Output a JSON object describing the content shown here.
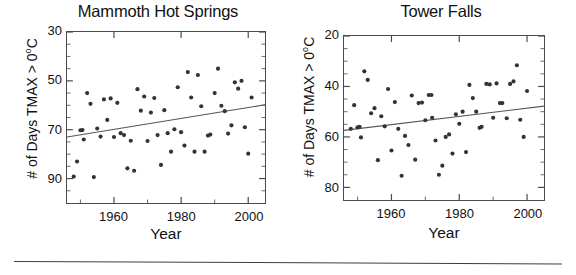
{
  "figure": {
    "panels": [
      {
        "id": "mammoth",
        "title": "Mammoth Hot Springs",
        "xlabel": "Year",
        "ylabel_main": "# of Days TMAX > 0",
        "ylabel_sup": "o",
        "ylabel_tail": "C",
        "ytick_labels": [
          "90",
          "70",
          "50",
          "30"
        ],
        "xtick_labels": [
          "1960",
          "1980",
          "2000"
        ]
      },
      {
        "id": "tower",
        "title": "Tower Falls",
        "xlabel": "Year",
        "ylabel_main": "# of Days TMAX > 0",
        "ylabel_sup": "o",
        "ylabel_tail": "C",
        "ytick_labels": [
          "80",
          "60",
          "40",
          "20"
        ],
        "xtick_labels": [
          "1960",
          "1980",
          "2000"
        ]
      }
    ]
  },
  "chart_data": [
    {
      "type": "scatter",
      "title": "Mammoth Hot Springs",
      "xlabel": "Year",
      "ylabel": "# of Days TMAX > 0°C",
      "xlim": [
        1946,
        2005
      ],
      "ylim": [
        20,
        90
      ],
      "yticks": [
        30,
        50,
        70,
        90
      ],
      "yticks_minor": [
        25,
        35,
        40,
        45,
        55,
        60,
        65,
        75,
        80,
        85
      ],
      "xticks": [
        1960,
        1980,
        2000
      ],
      "grid": false,
      "legend": null,
      "marker_color": "#333333",
      "line_color": "#555555",
      "trendline": {
        "x": [
          1946,
          2005
        ],
        "y": [
          47.0,
          60.2
        ]
      },
      "points": [
        {
          "x": 1948,
          "y": 30.8
        },
        {
          "x": 1949,
          "y": 37.0
        },
        {
          "x": 1950,
          "y": 49.8
        },
        {
          "x": 1950.6,
          "y": 49.9
        },
        {
          "x": 1951,
          "y": 46.0
        },
        {
          "x": 1952,
          "y": 65.0
        },
        {
          "x": 1953,
          "y": 60.6
        },
        {
          "x": 1954,
          "y": 30.6
        },
        {
          "x": 1955,
          "y": 50.5
        },
        {
          "x": 1956,
          "y": 47.2
        },
        {
          "x": 1957,
          "y": 62.4
        },
        {
          "x": 1958,
          "y": 54.0
        },
        {
          "x": 1959,
          "y": 62.8
        },
        {
          "x": 1960,
          "y": 47.0
        },
        {
          "x": 1961,
          "y": 61.0
        },
        {
          "x": 1962,
          "y": 48.6
        },
        {
          "x": 1963,
          "y": 47.8
        },
        {
          "x": 1964,
          "y": 34.2
        },
        {
          "x": 1965,
          "y": 45.5
        },
        {
          "x": 1966,
          "y": 33.2
        },
        {
          "x": 1967,
          "y": 66.6
        },
        {
          "x": 1968,
          "y": 57.8
        },
        {
          "x": 1969,
          "y": 63.6
        },
        {
          "x": 1970,
          "y": 45.4
        },
        {
          "x": 1971,
          "y": 57.0
        },
        {
          "x": 1972,
          "y": 63.0
        },
        {
          "x": 1973,
          "y": 47.8
        },
        {
          "x": 1974,
          "y": 35.6
        },
        {
          "x": 1975,
          "y": 58.0
        },
        {
          "x": 1976,
          "y": 48.6
        },
        {
          "x": 1977,
          "y": 41.0
        },
        {
          "x": 1978,
          "y": 50.2
        },
        {
          "x": 1979,
          "y": 67.4
        },
        {
          "x": 1980,
          "y": 49.0
        },
        {
          "x": 1981,
          "y": 43.5
        },
        {
          "x": 1982,
          "y": 73.6
        },
        {
          "x": 1983,
          "y": 63.2
        },
        {
          "x": 1984,
          "y": 41.0
        },
        {
          "x": 1985,
          "y": 72.4
        },
        {
          "x": 1986,
          "y": 59.6
        },
        {
          "x": 1987,
          "y": 41.0
        },
        {
          "x": 1988,
          "y": 47.6
        },
        {
          "x": 1988.7,
          "y": 48.0
        },
        {
          "x": 1990,
          "y": 65.0
        },
        {
          "x": 1991,
          "y": 75.0
        },
        {
          "x": 1992,
          "y": 59.8
        },
        {
          "x": 1993,
          "y": 57.6
        },
        {
          "x": 1994,
          "y": 48.4
        },
        {
          "x": 1995,
          "y": 51.8
        },
        {
          "x": 1996,
          "y": 69.4
        },
        {
          "x": 1997,
          "y": 66.8
        },
        {
          "x": 1998,
          "y": 70.0
        },
        {
          "x": 1999,
          "y": 51.0
        },
        {
          "x": 2000,
          "y": 40.2
        },
        {
          "x": 2001,
          "y": 63.2
        }
      ]
    },
    {
      "type": "scatter",
      "title": "Tower Falls",
      "xlabel": "Year",
      "ylabel": "# of Days TMAX > 0°C",
      "xlim": [
        1946,
        2005
      ],
      "ylim": [
        15,
        80
      ],
      "yticks": [
        20,
        40,
        60,
        80
      ],
      "yticks_minor": [
        25,
        30,
        35,
        45,
        50,
        55,
        65,
        70,
        75
      ],
      "xticks": [
        1960,
        1980,
        2000
      ],
      "grid": false,
      "legend": null,
      "marker_color": "#333333",
      "line_color": "#555555",
      "trendline": {
        "x": [
          1946,
          2005
        ],
        "y": [
          42.6,
          52.2
        ]
      },
      "points": [
        {
          "x": 1948,
          "y": 43.2
        },
        {
          "x": 1949,
          "y": 52.6
        },
        {
          "x": 1950,
          "y": 43.8
        },
        {
          "x": 1950.6,
          "y": 44.0
        },
        {
          "x": 1951,
          "y": 39.8
        },
        {
          "x": 1952,
          "y": 66.0
        },
        {
          "x": 1953,
          "y": 62.6
        },
        {
          "x": 1954,
          "y": 49.4
        },
        {
          "x": 1955,
          "y": 51.4
        },
        {
          "x": 1956,
          "y": 30.8
        },
        {
          "x": 1957,
          "y": 48.2
        },
        {
          "x": 1958,
          "y": 44.2
        },
        {
          "x": 1959,
          "y": 59.0
        },
        {
          "x": 1960,
          "y": 34.6
        },
        {
          "x": 1961,
          "y": 53.8
        },
        {
          "x": 1962,
          "y": 43.2
        },
        {
          "x": 1963,
          "y": 24.6
        },
        {
          "x": 1964,
          "y": 40.4
        },
        {
          "x": 1965,
          "y": 36.8
        },
        {
          "x": 1966,
          "y": 56.4
        },
        {
          "x": 1967,
          "y": 31.0
        },
        {
          "x": 1968,
          "y": 53.4
        },
        {
          "x": 1969,
          "y": 53.6
        },
        {
          "x": 1970,
          "y": 46.6
        },
        {
          "x": 1971,
          "y": 56.6
        },
        {
          "x": 1971.8,
          "y": 56.6
        },
        {
          "x": 1972,
          "y": 47.6
        },
        {
          "x": 1973,
          "y": 38.6
        },
        {
          "x": 1974,
          "y": 25.0
        },
        {
          "x": 1975,
          "y": 28.6
        },
        {
          "x": 1976,
          "y": 40.0
        },
        {
          "x": 1977,
          "y": 41.0
        },
        {
          "x": 1978,
          "y": 33.4
        },
        {
          "x": 1979,
          "y": 49.0
        },
        {
          "x": 1980,
          "y": 45.2
        },
        {
          "x": 1981,
          "y": 50.0
        },
        {
          "x": 1982,
          "y": 34.0
        },
        {
          "x": 1983,
          "y": 60.6
        },
        {
          "x": 1984,
          "y": 55.4
        },
        {
          "x": 1985,
          "y": 50.0
        },
        {
          "x": 1986,
          "y": 43.6
        },
        {
          "x": 1986.6,
          "y": 44.0
        },
        {
          "x": 1988,
          "y": 61.0
        },
        {
          "x": 1989,
          "y": 60.8
        },
        {
          "x": 1990,
          "y": 47.6
        },
        {
          "x": 1991,
          "y": 61.2
        },
        {
          "x": 1992,
          "y": 53.4
        },
        {
          "x": 1992.7,
          "y": 53.4
        },
        {
          "x": 1994,
          "y": 47.4
        },
        {
          "x": 1995,
          "y": 61.0
        },
        {
          "x": 1996,
          "y": 62.0
        },
        {
          "x": 1997,
          "y": 68.4
        },
        {
          "x": 1998,
          "y": 46.8
        },
        {
          "x": 1999,
          "y": 40.0
        },
        {
          "x": 2000,
          "y": 58.2
        }
      ]
    }
  ]
}
